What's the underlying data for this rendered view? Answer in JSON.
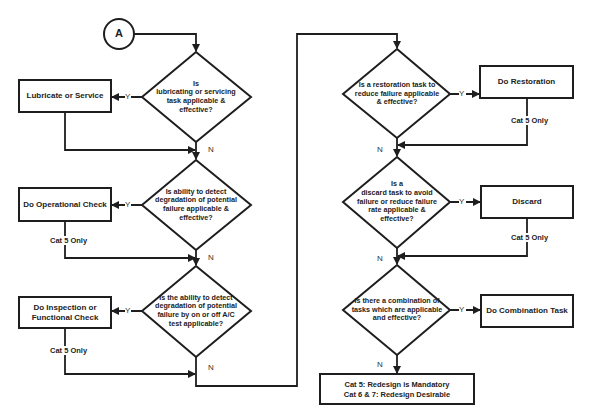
{
  "connector": {
    "label": "A"
  },
  "decisions": [
    {
      "id": "d1",
      "text": "Is\nlubricating or servicing\ntask applicable &\neffective?"
    },
    {
      "id": "d2",
      "text": "Is ability to detect\ndegradation of potential\nfailure applicable &\neffective?"
    },
    {
      "id": "d3",
      "text": "Is the ability to detect\ndegradation of potential\nfailure by on or off A/C\ntest applicable?"
    },
    {
      "id": "d4",
      "text": "Is a restoration task to\nreduce failure applicable\n& effective?"
    },
    {
      "id": "d5",
      "text": "Is a\ndiscard task to avoid\nfailure or reduce failure\nrate applicable &\neffective?"
    },
    {
      "id": "d6",
      "text": "Is there a combination of\ntasks which are applicable\nand effective?"
    }
  ],
  "actions": [
    {
      "id": "a1",
      "text": "Lubricate or Service"
    },
    {
      "id": "a2",
      "text": "Do Operational Check"
    },
    {
      "id": "a3",
      "text": "Do Inspection or\nFunctional Check"
    },
    {
      "id": "a4",
      "text": "Do Restoration"
    },
    {
      "id": "a5",
      "text": "Discard"
    },
    {
      "id": "a6",
      "text": "Do Combination Task"
    }
  ],
  "final": {
    "line1": "Cat 5:  Redesign is Mandatory",
    "line2": "Cat 6 & 7:  Redesign Desirable"
  },
  "branch_labels": {
    "yes": "Y",
    "no": "N"
  },
  "notes": {
    "cat5_only": "Cat 5 Only"
  },
  "colors": {
    "line": "#1e1e1e",
    "background": "#ffffff"
  }
}
